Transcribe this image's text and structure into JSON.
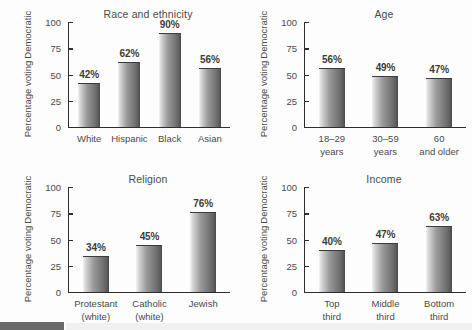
{
  "figure": {
    "background_color": "#fdfdfd",
    "bar_color_light": "#f2f2f2",
    "bar_color_dark": "#4a4a4a",
    "axis_color": "#2e2e2e",
    "text_color": "#4a4a4a"
  },
  "chart_data": [
    {
      "type": "bar",
      "title": "Race and ethnicity",
      "xlabel": "",
      "ylabel": "Percentage voting Democratic",
      "ylabel_line1": "Percentage voting",
      "ylabel_line2": "Democratic",
      "ylim": [
        0,
        100
      ],
      "yticks": [
        0,
        25,
        50,
        75,
        100
      ],
      "grid": false,
      "legend": "none",
      "categories": [
        "White",
        "Hispanic",
        "Black",
        "Asian"
      ],
      "values": [
        42,
        62,
        90,
        56
      ],
      "data_labels": [
        "42%",
        "62%",
        "90%",
        "56%"
      ]
    },
    {
      "type": "bar",
      "title": "Age",
      "xlabel": "",
      "ylabel": "Percentage voting Democratic",
      "ylabel_line1": "Percentage voting",
      "ylabel_line2": "Democratic",
      "ylim": [
        0,
        100
      ],
      "yticks": [
        0,
        25,
        50,
        75,
        100
      ],
      "grid": false,
      "legend": "none",
      "categories": [
        "18–29 years",
        "30–59 years",
        "60 and older"
      ],
      "category_lines": [
        [
          "18–29",
          "years"
        ],
        [
          "30–59",
          "years"
        ],
        [
          "60",
          "and older"
        ]
      ],
      "values": [
        56,
        49,
        47
      ],
      "data_labels": [
        "56%",
        "49%",
        "47%"
      ]
    },
    {
      "type": "bar",
      "title": "Religion",
      "xlabel": "",
      "ylabel": "Percentage voting Democratic",
      "ylabel_line1": "Percentage voting",
      "ylabel_line2": "Democratic",
      "ylim": [
        0,
        100
      ],
      "yticks": [
        0,
        25,
        50,
        75,
        100
      ],
      "grid": false,
      "legend": "none",
      "categories": [
        "Protestant (white)",
        "Catholic (white)",
        "Jewish"
      ],
      "category_lines": [
        [
          "Protestant",
          "(white)"
        ],
        [
          "Catholic",
          "(white)"
        ],
        [
          "Jewish",
          ""
        ]
      ],
      "values": [
        34,
        45,
        76
      ],
      "data_labels": [
        "34%",
        "45%",
        "76%"
      ]
    },
    {
      "type": "bar",
      "title": "Income",
      "xlabel": "",
      "ylabel": "Percentage voting Democratic",
      "ylabel_line1": "Percentage voting",
      "ylabel_line2": "Democratic",
      "ylim": [
        0,
        100
      ],
      "yticks": [
        0,
        25,
        50,
        75,
        100
      ],
      "grid": false,
      "legend": "none",
      "categories": [
        "Top third",
        "Middle third",
        "Bottom third"
      ],
      "category_lines": [
        [
          "Top",
          "third"
        ],
        [
          "Middle",
          "third"
        ],
        [
          "Bottom",
          "third"
        ]
      ],
      "values": [
        40,
        47,
        63
      ],
      "data_labels": [
        "40%",
        "47%",
        "63%"
      ]
    }
  ],
  "ytick_labels": [
    "100",
    "75",
    "50",
    "25",
    "0"
  ]
}
